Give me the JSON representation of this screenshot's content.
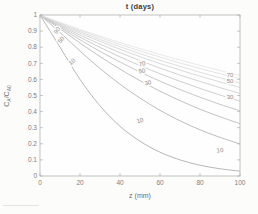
{
  "figure": {
    "background": "#fcfcfb"
  },
  "chart_data": {
    "type": "line",
    "title": "t (days)",
    "xlabel": "z (mm)",
    "ylabel": "C_A/C_A0",
    "ylabel_parts": {
      "base1": "C",
      "sub1": "A",
      "base2": "/C",
      "sub2": "A0"
    },
    "legend": "none",
    "grid": false,
    "xlim": [
      0,
      100
    ],
    "ylim": [
      0,
      1
    ],
    "xtick_values": [
      0,
      20,
      40,
      60,
      80,
      100
    ],
    "xtick_labels": [
      "0",
      "20",
      "40",
      "60",
      "80",
      "100"
    ],
    "ytick_values": [
      0,
      0.1,
      0.2,
      0.3,
      0.4,
      0.5,
      0.6,
      0.7,
      0.8,
      0.9,
      1
    ],
    "ytick_labels": [
      "0",
      "0.1",
      "0.2",
      "0.3",
      "0.4",
      "0.5",
      "0.6",
      "0.7",
      "0.8",
      "0.9",
      "1"
    ],
    "x": [
      0,
      10,
      20,
      30,
      40,
      50,
      60,
      70,
      80,
      90,
      100
    ],
    "series": [
      {
        "name": "t=10",
        "color": "#a5a5a5",
        "values": [
          1,
          0.8,
          0.6,
          0.436,
          0.309,
          0.216,
          0.148,
          0.1,
          0.067,
          0.045,
          0.03
        ]
      },
      {
        "name": "t=20",
        "color": "#acacac",
        "values": [
          1,
          0.892,
          0.776,
          0.668,
          0.57,
          0.484,
          0.408,
          0.343,
          0.287,
          0.24,
          0.199
        ]
      },
      {
        "name": "t=30",
        "color": "#b3b3b3",
        "values": [
          1,
          0.915,
          0.826,
          0.742,
          0.664,
          0.592,
          0.527,
          0.468,
          0.415,
          0.368,
          0.325
        ]
      },
      {
        "name": "t=40",
        "color": "#bababa",
        "values": [
          1,
          0.923,
          0.846,
          0.774,
          0.708,
          0.646,
          0.589,
          0.537,
          0.489,
          0.445,
          0.405
        ]
      },
      {
        "name": "t=50",
        "color": "#c1c1c1",
        "values": [
          1,
          0.93,
          0.862,
          0.799,
          0.74,
          0.686,
          0.635,
          0.588,
          0.544,
          0.503,
          0.465
        ]
      },
      {
        "name": "t=60",
        "color": "#c8c8c8",
        "values": [
          1,
          0.936,
          0.875,
          0.819,
          0.766,
          0.717,
          0.67,
          0.627,
          0.587,
          0.549,
          0.513
        ]
      },
      {
        "name": "t=70",
        "color": "#cfcfcf",
        "values": [
          1,
          0.942,
          0.887,
          0.836,
          0.787,
          0.741,
          0.698,
          0.658,
          0.62,
          0.584,
          0.55
        ]
      },
      {
        "name": "t=80",
        "color": "#d6d6d6",
        "values": [
          1,
          0.947,
          0.896,
          0.848,
          0.803,
          0.76,
          0.719,
          0.681,
          0.644,
          0.61,
          0.577
        ]
      },
      {
        "name": "t=90",
        "color": "#dcdcdc",
        "values": [
          1,
          0.951,
          0.904,
          0.86,
          0.817,
          0.777,
          0.739,
          0.702,
          0.668,
          0.635,
          0.604
        ]
      },
      {
        "name": "t=100",
        "color": "#e2e2e2",
        "values": [
          1,
          0.954,
          0.91,
          0.869,
          0.829,
          0.791,
          0.755,
          0.72,
          0.687,
          0.655,
          0.625
        ]
      }
    ],
    "contour_labels": [
      {
        "text": "90",
        "z": 8.5,
        "c": 0.905,
        "rot": -52
      },
      {
        "text": "50",
        "z": 10.5,
        "c": 0.845,
        "rot": -50
      },
      {
        "text": "10",
        "z": 16,
        "c": 0.71,
        "rot": -40
      },
      {
        "text": "70",
        "z": 51,
        "c": 0.697,
        "rot": -12
      },
      {
        "text": "50",
        "z": 51,
        "c": 0.652,
        "rot": -10
      },
      {
        "text": "30",
        "z": 54,
        "c": 0.578,
        "rot": -10
      },
      {
        "text": "10",
        "z": 50,
        "c": 0.345,
        "rot": -14
      },
      {
        "text": "70",
        "z": 95,
        "c": 0.625,
        "rot": 0
      },
      {
        "text": "50",
        "z": 95,
        "c": 0.588,
        "rot": 0
      },
      {
        "text": "30",
        "z": 95,
        "c": 0.49,
        "rot": 0
      },
      {
        "text": "10",
        "z": 90,
        "c": 0.16,
        "rot": -4
      }
    ],
    "colors": {
      "axis": "#b3b3b3",
      "plot_background": "#fefefe",
      "tick_text": "#7d7d7d",
      "title_text": "#3d3d3d",
      "axis_label_text": "#6e6e6e",
      "contour_label": "#8c8c8c",
      "halo": "#fcfcfb"
    }
  }
}
